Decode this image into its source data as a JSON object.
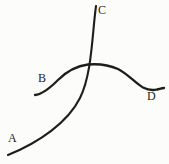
{
  "diagram": {
    "background_color": "#fcfcfa",
    "line_color": "#1e1e1c",
    "labels": {
      "a": "A",
      "b": "B",
      "c": "C",
      "d": "D"
    },
    "curves": {
      "ac": {
        "name": "curve from A to C",
        "description": "steep convex rising curve from lower-left (A) accelerating upward to top (C)",
        "path": "M 8 155 C 40 142, 68 122, 80 98 C 92 74, 92 35, 96 6"
      },
      "bd": {
        "name": "curve from B to D",
        "description": "gentle S/hump curve from left (B) rising to a plateau then dipping down to the right (D)",
        "path": "M 35 95 C 42 94.5, 50 88, 58 80 C 66 72, 76 66, 88 64.5 C 100 63.5, 108 64.5, 118 69 C 128 74, 135 83, 143 87.5 C 148 90, 153 90.5, 157 89.5 C 159.5 89, 161.5 88.3, 164 88"
      }
    },
    "crossing_point": {
      "x": 85,
      "y": 66
    }
  }
}
